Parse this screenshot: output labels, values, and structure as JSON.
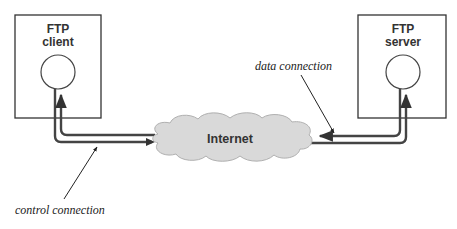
{
  "diagram": {
    "client": {
      "line1": "FTP",
      "line2": "client"
    },
    "server": {
      "line1": "FTP",
      "line2": "server"
    },
    "cloud": {
      "label": "Internet"
    },
    "labels": {
      "data_connection": "data connection",
      "control_connection": "control connection"
    },
    "colors": {
      "stroke": "#333333",
      "cloud_fill": "#d9d9d9",
      "background": "#ffffff"
    }
  }
}
